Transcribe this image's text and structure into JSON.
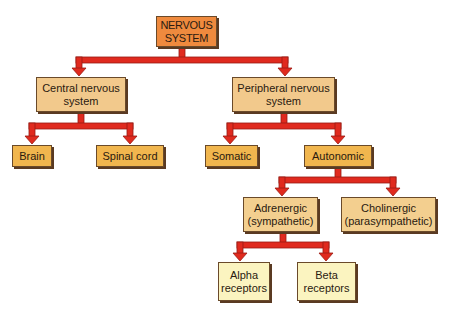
{
  "diagram": {
    "type": "hierarchy-tree",
    "colors": {
      "connector": "#e02a1e",
      "connector_edge": "#9a1a12",
      "root_fill": "#ef8a3e",
      "level2_fill": "#f2c98c",
      "level3_fill": "#f1b64e",
      "level4_fill": "#f3cf8f",
      "level5_fill": "#fbf4c0"
    },
    "nodes": {
      "root": {
        "label": "NERVOUS\nSYSTEM"
      },
      "central": {
        "label": "Central nervous\nsystem"
      },
      "peripheral": {
        "label": "Peripheral nervous\nsystem"
      },
      "brain": {
        "label": "Brain"
      },
      "spinal_cord": {
        "label": "Spinal cord"
      },
      "somatic": {
        "label": "Somatic"
      },
      "autonomic": {
        "label": "Autonomic"
      },
      "adrenergic": {
        "label": "Adrenergic\n(sympathetic)"
      },
      "cholinergic": {
        "label": "Cholinergic\n(parasympathetic)"
      },
      "alpha": {
        "label": "Alpha\nreceptors"
      },
      "beta": {
        "label": "Beta\nreceptors"
      }
    },
    "edges": [
      [
        "root",
        "central"
      ],
      [
        "root",
        "peripheral"
      ],
      [
        "central",
        "brain"
      ],
      [
        "central",
        "spinal_cord"
      ],
      [
        "peripheral",
        "somatic"
      ],
      [
        "peripheral",
        "autonomic"
      ],
      [
        "autonomic",
        "adrenergic"
      ],
      [
        "autonomic",
        "cholinergic"
      ],
      [
        "adrenergic",
        "alpha"
      ],
      [
        "adrenergic",
        "beta"
      ]
    ]
  }
}
